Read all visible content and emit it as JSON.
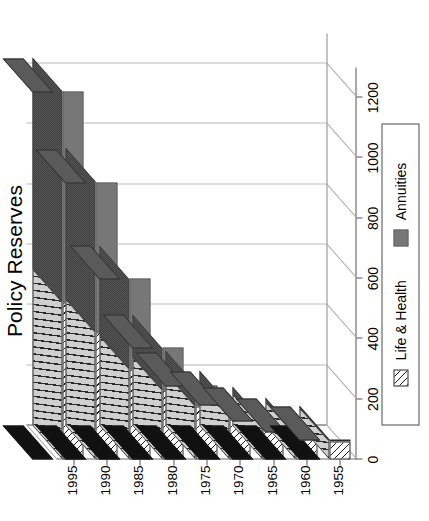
{
  "chart_data": {
    "type": "bar",
    "orientation": "horizontal-stacked-3d",
    "title": "Policy Reserves",
    "subtitle": "U.S. Life Companies ($ billions)",
    "xlabel": "",
    "ylabel": "",
    "categories": [
      "1955",
      "1960",
      "1965",
      "1970",
      "1975",
      "1980",
      "1985",
      "1990",
      "1995"
    ],
    "category_ticks": [
      "1955",
      "1960",
      "1965",
      "1970",
      "1975",
      "1980",
      "1985",
      "1990",
      "1995"
    ],
    "value_ticks": [
      "0",
      "200",
      "400",
      "600",
      "800",
      "1000",
      "1200"
    ],
    "value_tick_numbers": [
      0,
      200,
      400,
      600,
      800,
      1000,
      1200
    ],
    "xlim": [
      0,
      1300
    ],
    "grid": true,
    "legend_position": "bottom",
    "series": [
      {
        "name": "Life & Health",
        "pattern": "diagonal-hatch",
        "color": "#ffffff",
        "values": [
          60,
          78,
          105,
          140,
          175,
          230,
          300,
          420,
          520
        ]
      },
      {
        "name": "Annuities",
        "pattern": "gray-stipple",
        "color": "#9a9a9a",
        "values": [
          8,
          14,
          23,
          42,
          72,
          140,
          300,
          500,
          700
        ]
      }
    ],
    "totals": [
      68,
      92,
      128,
      182,
      247,
      370,
      600,
      920,
      1220
    ]
  },
  "legend": {
    "items": [
      {
        "label": "Life & Health",
        "swatch": "hatch-swatch"
      },
      {
        "label": "Annuities",
        "swatch": "stipple-swatch"
      }
    ]
  }
}
